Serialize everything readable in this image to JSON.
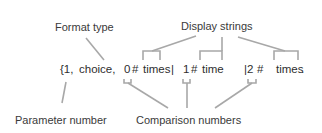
{
  "labels": {
    "format_type": "Format type",
    "display_strings": "Display strings",
    "parameter_number": "Parameter number",
    "comparison_numbers": "Comparison numbers"
  },
  "pattern": {
    "open": "{1,",
    "format": "choice,",
    "cases": [
      {
        "number": "0",
        "sep": "#",
        "text": "times",
        "pipe": "|"
      },
      {
        "number": "1",
        "sep": "#",
        "text": "time",
        "pipe": "|"
      },
      {
        "number": "2",
        "sep": "#",
        "text": "times",
        "pipe": ""
      }
    ],
    "pipe2": "|2",
    "hash2": "#",
    "close": "."
  },
  "colors": {
    "text": "#333333",
    "connector": "#a8a8a8",
    "background": "#ffffff"
  }
}
